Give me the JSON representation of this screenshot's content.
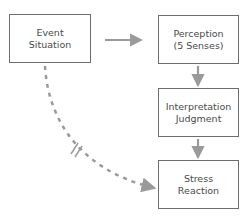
{
  "diagram": {
    "nodes": [
      {
        "id": "event",
        "lines": [
          "Event",
          "Situation"
        ]
      },
      {
        "id": "perception",
        "lines": [
          "Perception",
          "(5 Senses)"
        ]
      },
      {
        "id": "interpretation",
        "lines": [
          "Interpretation",
          "Judgment"
        ]
      },
      {
        "id": "stress",
        "lines": [
          "Stress",
          "Reaction"
        ]
      }
    ],
    "edges": [
      {
        "from": "event",
        "to": "perception",
        "style": "solid"
      },
      {
        "from": "perception",
        "to": "interpretation",
        "style": "solid"
      },
      {
        "from": "interpretation",
        "to": "stress",
        "style": "solid"
      },
      {
        "from": "event",
        "to": "stress",
        "style": "dashed",
        "broken": true
      }
    ],
    "colors": {
      "border": "#6e6e6e",
      "arrow": "#9a9a9a",
      "text": "#4a4a4a"
    }
  }
}
